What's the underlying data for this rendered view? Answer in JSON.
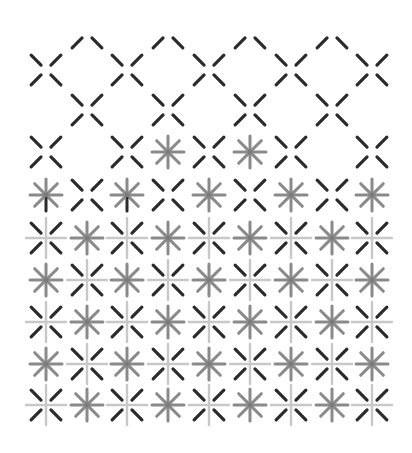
{
  "pattern": {
    "title": "",
    "colors": {
      "background": "#ffffff",
      "dark_stroke": "#2b2b2b",
      "mid_stroke": "#8a8a8a",
      "light_stroke": "#c8c8c8",
      "center_dot": "#7a7a7a"
    },
    "grid": {
      "columns": [
        46,
        87,
        127,
        168,
        209,
        250,
        291,
        332,
        372
      ],
      "arm_gap": 5,
      "arm_length": 16
    },
    "rows": [
      {
        "y": 33,
        "cells": [
          "",
          "top",
          "",
          "top",
          "",
          "top",
          "",
          "top",
          ""
        ]
      },
      {
        "y": 70,
        "cells": [
          "x",
          "",
          "x",
          "",
          "x",
          "",
          "x",
          "",
          "x"
        ]
      },
      {
        "y": 110,
        "cells": [
          "",
          "x",
          "",
          "x",
          "",
          "x",
          "",
          "x",
          ""
        ]
      },
      {
        "y": 152,
        "cells": [
          "x",
          "",
          "x",
          "star",
          "x",
          "star",
          "x",
          "",
          "x"
        ]
      },
      {
        "y": 195,
        "cells": [
          "star-dark",
          "x",
          "star-dark",
          "x",
          "star",
          "x",
          "star",
          "x",
          "star"
        ]
      },
      {
        "y": 238,
        "cells": [
          "xcross",
          "star",
          "xcross",
          "star",
          "xcross",
          "star",
          "xcross",
          "star",
          "xcross"
        ]
      },
      {
        "y": 280,
        "cells": [
          "star",
          "xcross",
          "star",
          "xcross",
          "star",
          "xcross",
          "star",
          "xcross",
          "star"
        ]
      },
      {
        "y": 322,
        "cells": [
          "xcross",
          "star",
          "xcross",
          "star",
          "xcross",
          "star",
          "xcross",
          "star",
          "xcross"
        ]
      },
      {
        "y": 364,
        "cells": [
          "star",
          "xcross",
          "star",
          "xcross",
          "star",
          "xcross",
          "star",
          "xcross",
          "star"
        ]
      },
      {
        "y": 405,
        "cells": [
          "xcross",
          "star",
          "xcross",
          "star",
          "xcross",
          "star",
          "xcross",
          "star",
          "xcross"
        ]
      }
    ],
    "glyph_legend": {
      "x": "dark diagonal x-mark (four separated strokes)",
      "top": "upper pair of strokes only",
      "star": "gray eight-armed asterisk",
      "star-dark": "gray asterisk with dark lower arm",
      "xcross": "dark x-mark over light plus-cross"
    }
  }
}
